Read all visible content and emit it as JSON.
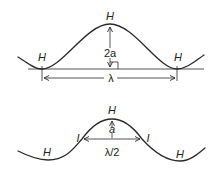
{
  "figure": {
    "top_diagram": {
      "title": "Full wavelength sine-like curve",
      "labels": {
        "left_trough": "H",
        "peak": "H",
        "right_trough": "H",
        "amplitude": "2a",
        "wavelength": "λ"
      }
    },
    "bottom_diagram": {
      "title": "Half wavelength between inflection points",
      "labels": {
        "peak": "H",
        "left_inflection": "I",
        "right_inflection": "I",
        "left_trough": "H",
        "right_trough": "H",
        "amplitude": "a",
        "half_wavelength": "λ/2"
      }
    },
    "colors": {
      "ink": "#2a2a2a",
      "background": "#ffffff"
    }
  }
}
